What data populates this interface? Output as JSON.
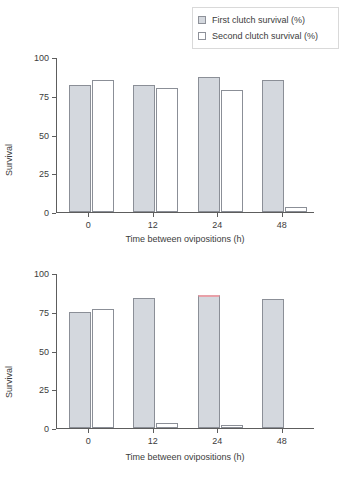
{
  "legend": {
    "position": "top-right",
    "entries": [
      {
        "label": "First clutch survival (%)",
        "swatch": "gray",
        "color": "#d4d8de"
      },
      {
        "label": "Second clutch survival (%)",
        "swatch": "white",
        "color": "#ffffff"
      }
    ]
  },
  "axis": {
    "ylabel": "Survival",
    "xlabel": "Time between ovipositions (h)",
    "yticks": [
      "0",
      "25",
      "50",
      "75",
      "100"
    ],
    "xticks": [
      "0",
      "12",
      "24",
      "48"
    ]
  },
  "chart_data": [
    {
      "panel": "top",
      "type": "bar",
      "title": "",
      "xlabel": "Time between ovipositions (h)",
      "ylabel": "Survival",
      "categories": [
        "0",
        "12",
        "24",
        "48"
      ],
      "ylim": [
        0,
        100
      ],
      "yticks": [
        0,
        25,
        50,
        75,
        100
      ],
      "grid": false,
      "legend_position": "top-right",
      "series": [
        {
          "name": "First clutch survival (%)",
          "color": "#d4d8de",
          "values": [
            82,
            82,
            87,
            85
          ]
        },
        {
          "name": "Second clutch survival (%)",
          "color": "#ffffff",
          "values": [
            85,
            80,
            79,
            3
          ]
        }
      ]
    },
    {
      "panel": "bottom",
      "type": "bar",
      "title": "",
      "xlabel": "Time between ovipositions (h)",
      "ylabel": "Survival",
      "categories": [
        "0",
        "12",
        "24",
        "48"
      ],
      "ylim": [
        0,
        100
      ],
      "yticks": [
        0,
        25,
        50,
        75,
        100
      ],
      "grid": false,
      "legend_position": "top-right",
      "series": [
        {
          "name": "First clutch survival (%)",
          "color": "#d4d8de",
          "values": [
            75,
            84,
            86,
            83
          ],
          "highlight_index": 2,
          "highlight_color": "#e8a0a8"
        },
        {
          "name": "Second clutch survival (%)",
          "color": "#ffffff",
          "values": [
            77,
            3,
            2,
            0
          ]
        }
      ]
    }
  ]
}
